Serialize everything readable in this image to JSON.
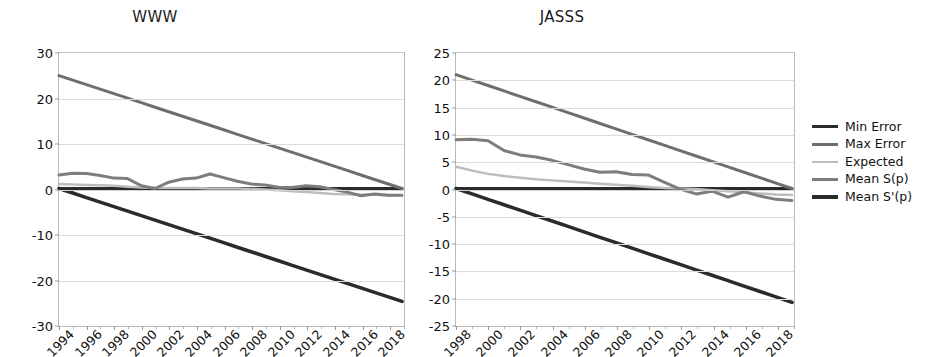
{
  "figure": {
    "background": "#ffffff"
  },
  "legend": {
    "position": "right",
    "items": [
      {
        "label": "Min Error",
        "color": "#2b2b2b",
        "width": 3
      },
      {
        "label": "Max Error",
        "color": "#6e6e6e",
        "width": 3
      },
      {
        "label": "Expected",
        "color": "#bdbdbd",
        "width": 2.5
      },
      {
        "label": "Mean S(p)",
        "color": "#7d7d7d",
        "width": 3
      },
      {
        "label": "Mean S'(p)",
        "color": "#2b2b2b",
        "width": 3.5
      }
    ]
  },
  "chart_data": [
    {
      "type": "line",
      "title": "WWW",
      "xlabel": "",
      "ylabel": "",
      "xlim": [
        1994,
        2019
      ],
      "ylim": [
        -30,
        30
      ],
      "yticks": [
        30,
        20,
        10,
        0,
        -10,
        -20,
        -30
      ],
      "ytick_labels": [
        "30",
        "20",
        "10",
        "0",
        "-10",
        "-20",
        "-30"
      ],
      "xticks": [
        1994,
        1996,
        1998,
        2000,
        2002,
        2004,
        2006,
        2008,
        2010,
        2012,
        2014,
        2016,
        2018
      ],
      "xtick_labels": [
        "1994",
        "1996",
        "1998",
        "2000",
        "2002",
        "2004",
        "2006",
        "2008",
        "2010",
        "2012",
        "2014",
        "2016",
        "2018"
      ],
      "grid": true,
      "x": [
        1994,
        1995,
        1996,
        1997,
        1998,
        1999,
        2000,
        2001,
        2002,
        2003,
        2004,
        2005,
        2006,
        2007,
        2008,
        2009,
        2010,
        2011,
        2012,
        2013,
        2014,
        2015,
        2016,
        2017,
        2018,
        2019
      ],
      "series": [
        {
          "name": "Min Error",
          "color": "#2b2b2b",
          "width": 3,
          "values": [
            0,
            0,
            0,
            0,
            0,
            0,
            0,
            0,
            0,
            0,
            0,
            0,
            0,
            0,
            0,
            0,
            0,
            0,
            0,
            0,
            0,
            0,
            0,
            0,
            0,
            0
          ]
        },
        {
          "name": "Max Error",
          "color": "#6e6e6e",
          "width": 3,
          "values": [
            25,
            24,
            23,
            22,
            21,
            20,
            19,
            18,
            17,
            16,
            15,
            14,
            13,
            12,
            11,
            10,
            9,
            8,
            7,
            6,
            5,
            4,
            3,
            2,
            1,
            0
          ]
        },
        {
          "name": "Expected",
          "color": "#bdbdbd",
          "width": 2.5,
          "values": [
            1.0,
            0.9,
            0.8,
            0.7,
            0.6,
            0.4,
            0.2,
            0.1,
            0.1,
            0.1,
            0.1,
            0.0,
            0.0,
            0.0,
            -0.1,
            -0.2,
            -0.4,
            -0.6,
            -0.8,
            -1.0,
            -1.2,
            -1.3,
            -1.4,
            -1.4,
            -1.5,
            -1.5
          ]
        },
        {
          "name": "Mean S(p)",
          "color": "#7d7d7d",
          "width": 3,
          "values": [
            3.0,
            3.4,
            3.3,
            2.9,
            2.3,
            2.2,
            0.6,
            0.0,
            1.4,
            2.1,
            2.3,
            3.2,
            2.4,
            1.6,
            1.0,
            0.8,
            0.3,
            0.2,
            0.6,
            0.4,
            -0.2,
            -0.8,
            -1.6,
            -1.2,
            -1.5,
            -1.5
          ]
        },
        {
          "name": "Mean S'(p)",
          "color": "#2b2b2b",
          "width": 3.5,
          "values": [
            0,
            -1,
            -2,
            -3,
            -4,
            -5,
            -6,
            -7,
            -8,
            -9,
            -10,
            -11,
            -12,
            -13,
            -14,
            -15,
            -16,
            -17,
            -18,
            -19,
            -20,
            -21,
            -22,
            -23,
            -24,
            -25
          ]
        }
      ]
    },
    {
      "type": "line",
      "title": "JASSS",
      "xlabel": "",
      "ylabel": "",
      "xlim": [
        1998,
        2019
      ],
      "ylim": [
        -25,
        25
      ],
      "yticks": [
        25,
        20,
        15,
        10,
        5,
        0,
        -5,
        -10,
        -15,
        -20,
        -25
      ],
      "ytick_labels": [
        "25",
        "20",
        "15",
        "10",
        "5",
        "0",
        "-5",
        "-10",
        "-15",
        "-20",
        "-25"
      ],
      "xticks": [
        1998,
        2000,
        2002,
        2004,
        2006,
        2008,
        2010,
        2012,
        2014,
        2016,
        2018
      ],
      "xtick_labels": [
        "1998",
        "2000",
        "2002",
        "2004",
        "2006",
        "2008",
        "2010",
        "2012",
        "2014",
        "2016",
        "2018"
      ],
      "grid": true,
      "x": [
        1998,
        1999,
        2000,
        2001,
        2002,
        2003,
        2004,
        2005,
        2006,
        2007,
        2008,
        2009,
        2010,
        2011,
        2012,
        2013,
        2014,
        2015,
        2016,
        2017,
        2018,
        2019
      ],
      "series": [
        {
          "name": "Min Error",
          "color": "#2b2b2b",
          "width": 3,
          "values": [
            0,
            0,
            0,
            0,
            0,
            0,
            0,
            0,
            0,
            0,
            0,
            0,
            0,
            0,
            0,
            0,
            0,
            0,
            0,
            0,
            0,
            0
          ]
        },
        {
          "name": "Max Error",
          "color": "#6e6e6e",
          "width": 3,
          "values": [
            21,
            20,
            19,
            18,
            17,
            16,
            15,
            14,
            13,
            12,
            11,
            10,
            9,
            8,
            7,
            6,
            5,
            4,
            3,
            2,
            1,
            0
          ]
        },
        {
          "name": "Expected",
          "color": "#bdbdbd",
          "width": 2.5,
          "values": [
            4.0,
            3.3,
            2.7,
            2.3,
            2.0,
            1.7,
            1.5,
            1.3,
            1.1,
            0.9,
            0.7,
            0.5,
            0.3,
            0.1,
            0.0,
            -0.1,
            -0.3,
            -0.5,
            -0.7,
            -0.9,
            -1.1,
            -1.2
          ]
        },
        {
          "name": "Mean S(p)",
          "color": "#7d7d7d",
          "width": 3,
          "values": [
            9.0,
            9.1,
            8.8,
            7.0,
            6.2,
            5.8,
            5.2,
            4.4,
            3.6,
            3.0,
            3.1,
            2.6,
            2.5,
            1.2,
            -0.1,
            -1.0,
            -0.5,
            -1.6,
            -0.6,
            -1.4,
            -2.0,
            -2.2
          ]
        },
        {
          "name": "Mean S'(p)",
          "color": "#2b2b2b",
          "width": 3.5,
          "values": [
            0,
            -1,
            -2,
            -3,
            -4,
            -5,
            -6,
            -7,
            -8,
            -9,
            -10,
            -11,
            -12,
            -13,
            -14,
            -15,
            -16,
            -17,
            -18,
            -19,
            -20,
            -21
          ]
        }
      ]
    }
  ]
}
